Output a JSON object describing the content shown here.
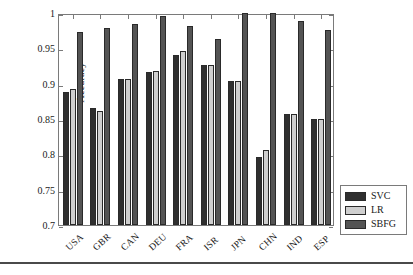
{
  "chart_data": {
    "type": "bar",
    "title": "",
    "xlabel": "",
    "ylabel": "Accuracy",
    "categories": [
      "USA",
      "GBR",
      "CAN",
      "DEU",
      "FRA",
      "ISR",
      "JPN",
      "CHN",
      "IND",
      "ESP"
    ],
    "series": [
      {
        "name": "SVC",
        "color": "#2f2f2f",
        "values": [
          0.888,
          0.865,
          0.907,
          0.917,
          0.941,
          0.927,
          0.904,
          0.796,
          0.857,
          0.85
        ]
      },
      {
        "name": "LR",
        "color": "#cfcfcf",
        "values": [
          0.893,
          0.862,
          0.907,
          0.918,
          0.946,
          0.927,
          0.904,
          0.806,
          0.857,
          0.85
        ]
      },
      {
        "name": "SBFG",
        "color": "#545454",
        "values": [
          0.973,
          0.979,
          0.984,
          0.996,
          0.982,
          0.963,
          1.0,
          1.0,
          0.988,
          0.976
        ]
      }
    ],
    "ylim": [
      0.7,
      1.0
    ],
    "yticks": [
      0.7,
      0.75,
      0.8,
      0.85,
      0.9,
      0.95,
      1
    ],
    "ytick_labels": [
      "0.7",
      "0.75",
      "0.8",
      "0.85",
      "0.9",
      "0.95",
      "1"
    ],
    "grid": false,
    "legend_position": "bottom-right",
    "legend_entries": [
      "SVC",
      "LR",
      "SBFG"
    ]
  },
  "legend": {
    "items": [
      {
        "label": "SVC",
        "swatch": "svc-color-swatch"
      },
      {
        "label": "LR",
        "swatch": "lr-color-swatch"
      },
      {
        "label": "SBFG",
        "swatch": "sbfg-color-swatch"
      }
    ]
  },
  "axes": {
    "y_label": "Accuracy"
  }
}
